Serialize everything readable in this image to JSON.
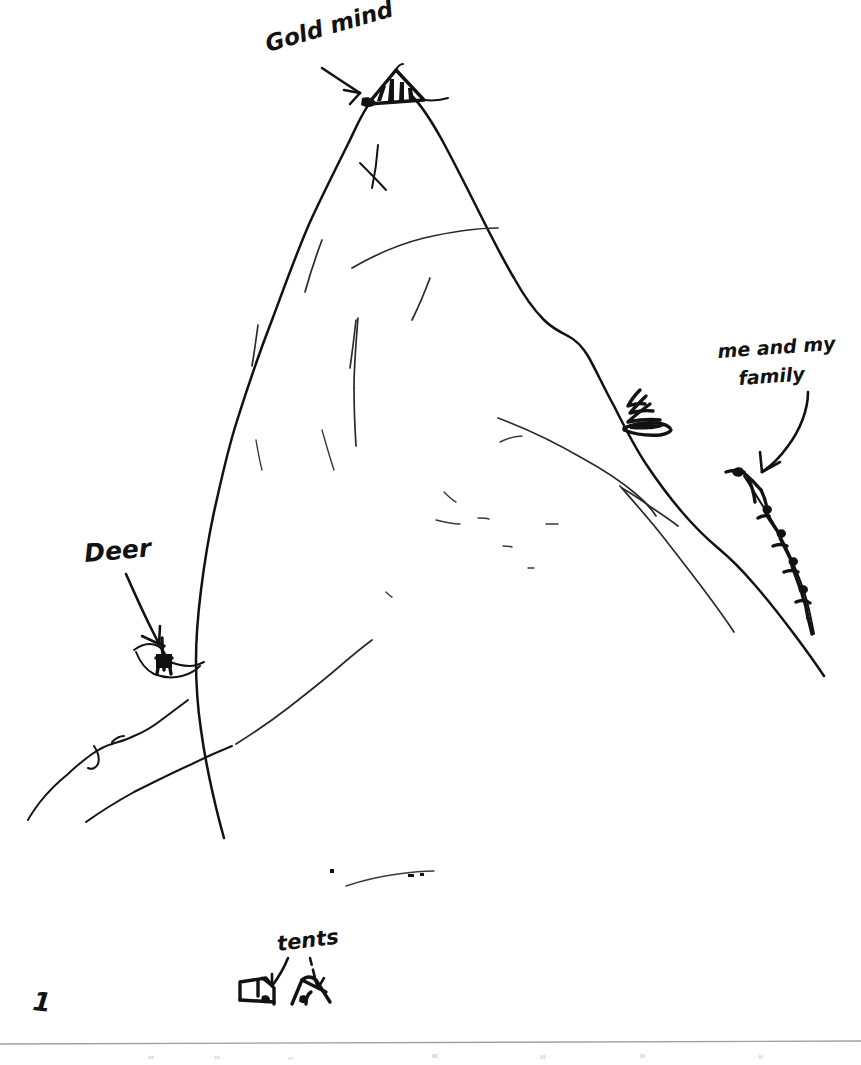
{
  "page": {
    "kind": "hand-drawn-pencil-sketch",
    "background_color": "#ffffff",
    "ink_color": "#121212",
    "border_color": "#9aa0a6",
    "width": 861,
    "height": 1065
  },
  "labels": {
    "gold_mine": {
      "text": "Gold mind",
      "x": 268,
      "y": 52,
      "rotation": -16,
      "font_size": 23
    },
    "me_and_my_family_line1": {
      "text": "me and my",
      "x": 718,
      "y": 358,
      "rotation": -4,
      "font_size": 19
    },
    "me_and_my_family_line2": {
      "text": "family",
      "x": 739,
      "y": 385,
      "rotation": -4,
      "font_size": 19
    },
    "deer": {
      "text": "Deer",
      "x": 85,
      "y": 562,
      "rotation": -5,
      "font_size": 25
    },
    "tents": {
      "text": "tents",
      "x": 278,
      "y": 951,
      "rotation": -7,
      "font_size": 21
    },
    "page_number": {
      "text": "1",
      "x": 32,
      "y": 1010,
      "rotation": 6,
      "font_size": 26
    }
  },
  "scene_objects": {
    "mountain": {
      "name": "large central mountain peak",
      "summit_x": 390,
      "summit_y": 72
    },
    "gold_mine_structure": {
      "name": "striped mine entrance at summit",
      "stripe_count": 4
    },
    "conifer_tree": {
      "name": "small pine tree on right shoulder",
      "x": 640,
      "y": 412
    },
    "deer_figure": {
      "name": "deer standing on left ledge",
      "x": 163,
      "y": 658
    },
    "climber_chain": {
      "name": "chain of stick-figure climbers on right ridge",
      "figure_count": 5
    },
    "tent_left": {
      "name": "left tent shape",
      "x": 252,
      "y": 990
    },
    "tent_right": {
      "name": "right tent shape",
      "x": 305,
      "y": 992
    },
    "summit_cross_mark": {
      "name": "x crossing mark below summit"
    }
  },
  "arrows": {
    "gold_mine_arrow": {
      "from_x": 330,
      "from_y": 75,
      "to_x": 372,
      "to_y": 98
    },
    "family_arrow": {
      "from_x": 795,
      "from_y": 395,
      "to_x": 762,
      "to_y": 470
    },
    "deer_arrow": {
      "from_x": 122,
      "from_y": 578,
      "to_x": 158,
      "to_y": 645
    },
    "tent_arrow_left": {
      "from_x": 285,
      "from_y": 958,
      "to_x": 265,
      "to_y": 985
    },
    "tent_arrow_right": {
      "from_x": 312,
      "from_y": 958,
      "to_x": 318,
      "to_y": 985
    }
  }
}
